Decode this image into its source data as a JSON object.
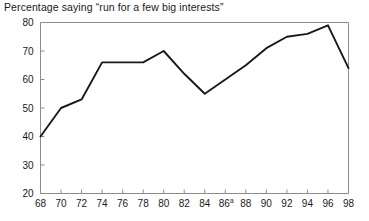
{
  "chart_data": {
    "type": "line",
    "title": "Percentage saying “run for a few big interests”",
    "xlabel": "",
    "ylabel": "",
    "xlim": [
      68,
      98
    ],
    "ylim": [
      20,
      80
    ],
    "grid": false,
    "legend": null,
    "x_tick_labels": [
      "68",
      "70",
      "72",
      "74",
      "76",
      "78",
      "80",
      "82",
      "84",
      "86",
      "88",
      "90",
      "92",
      "94",
      "96",
      "98"
    ],
    "x_tick_superscripts": [
      "",
      "",
      "",
      "",
      "",
      "",
      "",
      "",
      "",
      "a",
      "",
      "",
      "",
      "",
      "",
      ""
    ],
    "y_tick_labels": [
      "20",
      "30",
      "40",
      "50",
      "60",
      "70",
      "80"
    ],
    "x": [
      68,
      70,
      72,
      74,
      76,
      78,
      80,
      82,
      84,
      86,
      88,
      90,
      92,
      94,
      96,
      98
    ],
    "values": [
      40,
      50,
      53,
      66,
      66,
      66,
      70,
      62,
      55,
      60,
      65,
      71,
      75,
      76,
      79,
      64
    ],
    "series_name": "Percentage saying run for a few big interests",
    "line_color": "#1a1a1a",
    "axis_color": "#8c8c8c",
    "background_color": "#ffffff"
  }
}
